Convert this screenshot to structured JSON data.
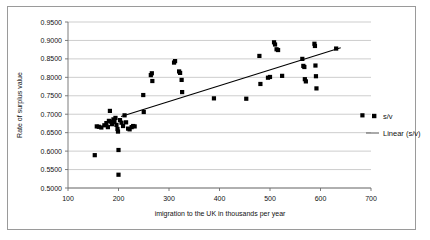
{
  "figure": {
    "border_color": "#9a9a9a",
    "background": "#ffffff"
  },
  "axis": {
    "y_title": "Rate of surplus value",
    "x_title": "imigration to the UK in thousands per year",
    "y_ticks": [
      "0.5000",
      "0.5500",
      "0.6000",
      "0.6500",
      "0.7000",
      "0.7500",
      "0.8000",
      "0.8500",
      "0.9000",
      "0.9500"
    ],
    "x_ticks": [
      "100",
      "200",
      "300",
      "400",
      "500",
      "600",
      "700"
    ]
  },
  "legend": {
    "items": [
      {
        "label": "s/v",
        "kind": "marker",
        "color": "#000000"
      },
      {
        "label": "Linear (s/v)",
        "kind": "line",
        "color": "#555555"
      }
    ]
  },
  "chart_data": {
    "type": "scatter",
    "title": "",
    "xlabel": "imigration to the UK in thousands per year",
    "ylabel": "Rate of surplus value",
    "xlim": [
      100,
      700
    ],
    "ylim": [
      0.5,
      0.95
    ],
    "xticks": [
      100,
      200,
      300,
      400,
      500,
      600,
      700
    ],
    "yticks": [
      0.5,
      0.55,
      0.6,
      0.65,
      0.7,
      0.75,
      0.8,
      0.85,
      0.9,
      0.95
    ],
    "grid": "horizontal",
    "legend_position": "right",
    "series": [
      {
        "name": "s/v",
        "type": "scatter",
        "marker": "square",
        "color": "#000000",
        "points": [
          [
            153,
            0.589
          ],
          [
            157,
            0.667
          ],
          [
            161,
            0.666
          ],
          [
            166,
            0.664
          ],
          [
            172,
            0.67
          ],
          [
            176,
            0.676
          ],
          [
            179,
            0.665
          ],
          [
            181,
            0.682
          ],
          [
            183,
            0.709
          ],
          [
            185,
            0.68
          ],
          [
            187,
            0.673
          ],
          [
            190,
            0.686
          ],
          [
            192,
            0.679
          ],
          [
            194,
            0.69
          ],
          [
            196,
            0.671
          ],
          [
            198,
            0.66
          ],
          [
            199,
            0.653
          ],
          [
            200,
            0.603
          ],
          [
            200,
            0.536
          ],
          [
            203,
            0.684
          ],
          [
            206,
            0.677
          ],
          [
            209,
            0.668
          ],
          [
            212,
            0.697
          ],
          [
            215,
            0.678
          ],
          [
            219,
            0.661
          ],
          [
            222,
            0.659
          ],
          [
            226,
            0.665
          ],
          [
            229,
            0.668
          ],
          [
            232,
            0.667
          ],
          [
            249,
            0.752
          ],
          [
            250,
            0.706
          ],
          [
            264,
            0.806
          ],
          [
            266,
            0.811
          ],
          [
            267,
            0.79
          ],
          [
            310,
            0.84
          ],
          [
            312,
            0.844
          ],
          [
            320,
            0.816
          ],
          [
            322,
            0.812
          ],
          [
            325,
            0.793
          ],
          [
            326,
            0.76
          ],
          [
            389,
            0.743
          ],
          [
            453,
            0.742
          ],
          [
            479,
            0.858
          ],
          [
            481,
            0.782
          ],
          [
            496,
            0.799
          ],
          [
            500,
            0.801
          ],
          [
            508,
            0.895
          ],
          [
            510,
            0.889
          ],
          [
            513,
            0.876
          ],
          [
            516,
            0.874
          ],
          [
            524,
            0.804
          ],
          [
            564,
            0.85
          ],
          [
            566,
            0.831
          ],
          [
            568,
            0.828
          ],
          [
            569,
            0.795
          ],
          [
            571,
            0.789
          ],
          [
            588,
            0.891
          ],
          [
            589,
            0.885
          ],
          [
            590,
            0.832
          ],
          [
            591,
            0.803
          ],
          [
            592,
            0.77
          ],
          [
            631,
            0.878
          ],
          [
            683,
            0.697
          ]
        ]
      },
      {
        "name": "Linear (s/v)",
        "type": "line",
        "color": "#000000",
        "endpoints": [
          [
            205,
            0.694
          ],
          [
            640,
            0.88
          ]
        ]
      }
    ]
  }
}
